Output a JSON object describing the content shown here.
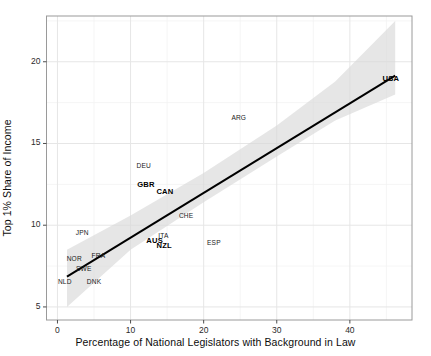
{
  "chart_data": {
    "type": "scatter",
    "title": "",
    "xlabel": "Percentage of National Legislators with Background in Law",
    "ylabel": "Top 1% Share of Income",
    "xlim": [
      -1.5,
      48.5
    ],
    "ylim": [
      4.2,
      22.8
    ],
    "xticks": [
      0,
      10,
      20,
      30,
      40
    ],
    "yticks": [
      5,
      10,
      15,
      20
    ],
    "xtick_labels": [
      "0",
      "10",
      "20",
      "30",
      "40"
    ],
    "ytick_labels": [
      "5",
      "10",
      "15",
      "20"
    ],
    "grid": true,
    "legend": "none",
    "point_style": "text-labels-only",
    "points": [
      {
        "label": "NLD",
        "x": 1.0,
        "y": 6.6,
        "highlight": false
      },
      {
        "label": "NOR",
        "x": 2.3,
        "y": 8.0,
        "highlight": false
      },
      {
        "label": "JPN",
        "x": 3.4,
        "y": 9.6,
        "highlight": false
      },
      {
        "label": "SWE",
        "x": 3.6,
        "y": 7.4,
        "highlight": false
      },
      {
        "label": "DNK",
        "x": 5.0,
        "y": 6.6,
        "highlight": false
      },
      {
        "label": "FRA",
        "x": 5.6,
        "y": 8.2,
        "highlight": false
      },
      {
        "label": "DEU",
        "x": 11.8,
        "y": 13.7,
        "highlight": false
      },
      {
        "label": "GBR",
        "x": 12.1,
        "y": 12.5,
        "highlight": true
      },
      {
        "label": "AUS",
        "x": 13.3,
        "y": 9.1,
        "highlight": true
      },
      {
        "label": "ITA",
        "x": 14.5,
        "y": 9.4,
        "highlight": false
      },
      {
        "label": "CAN",
        "x": 14.7,
        "y": 12.1,
        "highlight": true
      },
      {
        "label": "NZL",
        "x": 14.6,
        "y": 8.8,
        "highlight": true
      },
      {
        "label": "CHE",
        "x": 17.6,
        "y": 10.6,
        "highlight": false
      },
      {
        "label": "ESP",
        "x": 21.4,
        "y": 9.0,
        "highlight": false
      },
      {
        "label": "ARG",
        "x": 24.8,
        "y": 16.6,
        "highlight": false
      },
      {
        "label": "USA",
        "x": 45.6,
        "y": 19.0,
        "highlight": true
      }
    ],
    "regression_line": {
      "x_start": 1.3,
      "y_start": 6.85,
      "x_end": 46.2,
      "y_end": 19.15,
      "color": "#000000",
      "width": 2.0
    },
    "confidence_band": {
      "color": "#d9d9d9",
      "opacity": 0.65,
      "upper": [
        {
          "x": 1.3,
          "y": 8.5
        },
        {
          "x": 10.0,
          "y": 10.6
        },
        {
          "x": 20.0,
          "y": 13.2
        },
        {
          "x": 30.0,
          "y": 16.1
        },
        {
          "x": 38.0,
          "y": 18.8
        },
        {
          "x": 46.2,
          "y": 22.5
        }
      ],
      "lower": [
        {
          "x": 1.3,
          "y": 5.0
        },
        {
          "x": 10.0,
          "y": 8.5
        },
        {
          "x": 20.0,
          "y": 11.4
        },
        {
          "x": 30.0,
          "y": 14.2
        },
        {
          "x": 38.0,
          "y": 16.4
        },
        {
          "x": 46.2,
          "y": 18.0
        }
      ]
    },
    "style": {
      "background": "#ffffff",
      "panel_background": "#ffffff",
      "grid_major_color": "#e6e6e6",
      "grid_minor_color": "#f2f2f2",
      "frame_color": "#9a9a9a",
      "tick_color": "#4d4d4d",
      "text_color": "#1a1a1a"
    }
  }
}
